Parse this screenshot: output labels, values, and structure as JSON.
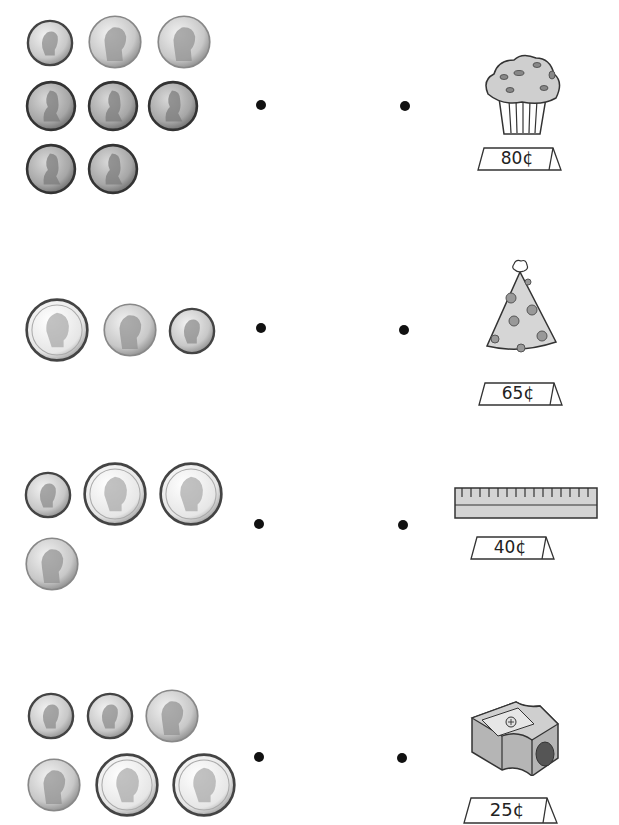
{
  "worksheet": {
    "instructions": "",
    "rows": [
      {
        "coins": [
          "dime",
          "nickel",
          "nickel",
          "penny",
          "penny",
          "penny",
          "penny",
          "penny"
        ],
        "coin_total_cents": 25,
        "item": "muffin",
        "price_label": "80¢"
      },
      {
        "coins": [
          "quarter",
          "nickel",
          "dime"
        ],
        "coin_total_cents": 40,
        "item": "party-hat",
        "price_label": "65¢"
      },
      {
        "coins": [
          "dime",
          "quarter",
          "quarter",
          "nickel"
        ],
        "coin_total_cents": 65,
        "item": "ruler",
        "price_label": "40¢"
      },
      {
        "coins": [
          "dime",
          "dime",
          "nickel",
          "nickel",
          "quarter",
          "quarter"
        ],
        "coin_total_cents": 80,
        "item": "pencil-sharpener",
        "price_label": "25¢"
      }
    ]
  },
  "colors": {
    "coin_silver": "#c9c9c9",
    "coin_copper": "#a8a8a8",
    "item_fill": "#cfcfcf",
    "dot": "#111111",
    "outline": "#333333"
  }
}
